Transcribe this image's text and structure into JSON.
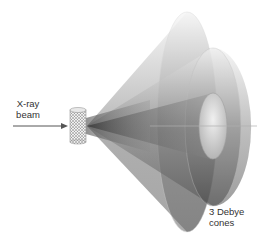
{
  "diagram": {
    "beam_label": {
      "line1": "X-ray",
      "line2": "beam"
    },
    "cones_label": {
      "line1": "3 Debye",
      "line2": "cones"
    },
    "elements": {
      "sample": "powder sample cylinder",
      "arrow": "incident x-ray beam arrow",
      "cones": [
        "outer Debye cone",
        "middle Debye cone",
        "inner Debye cone"
      ]
    },
    "colors": {
      "background": "#ffffff",
      "text": "#333333",
      "cone_dark": "#3a3a3a",
      "cone_light": "#e6e6e6",
      "arrow": "#555555"
    }
  }
}
